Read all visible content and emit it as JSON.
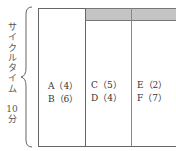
{
  "cycle_time_label": {
    "chars": [
      "サ",
      "イ",
      "ク",
      "ル",
      "タ",
      "イ",
      "ム"
    ],
    "value": "10",
    "unit": "分"
  },
  "columns": [
    {
      "header_shaded": false,
      "items": [
        "A（4）",
        "B（6）"
      ]
    },
    {
      "header_shaded": true,
      "items": [
        "C（5）",
        "D（4）"
      ]
    },
    {
      "header_shaded": true,
      "items": [
        "E（2）",
        "F（7）"
      ]
    }
  ],
  "colors": {
    "header_fill": "#c4c4c4",
    "border": "#666666"
  }
}
